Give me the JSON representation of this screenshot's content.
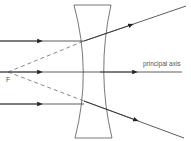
{
  "diagram": {
    "labels": {
      "axis": "principal axis",
      "focal_point": "F"
    },
    "colors": {
      "line": "#333333",
      "lens": "#555555",
      "text": "#555555",
      "background": "#ffffff"
    }
  }
}
